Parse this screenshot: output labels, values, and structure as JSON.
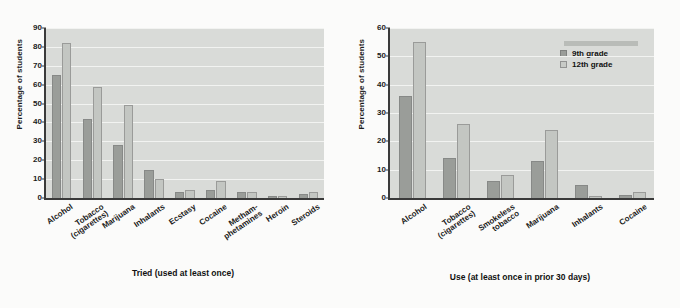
{
  "figure": {
    "background": "#fbfbfa",
    "legend": {
      "position": "top-right",
      "items": [
        {
          "label": "9th grade",
          "color": "#9a9d99"
        },
        {
          "label": "12th grade",
          "color": "#c8cbc7"
        }
      ]
    }
  },
  "chart_data": [
    {
      "type": "bar",
      "title": "",
      "xlabel": "Tried (used at least once)",
      "ylabel": "Percentage of students",
      "ylim": [
        0,
        90
      ],
      "yticks": [
        0,
        10,
        20,
        30,
        40,
        50,
        60,
        70,
        80,
        90
      ],
      "grid": true,
      "legend_position": "none",
      "categories": [
        "Alcohol",
        "Tobacco (cigarettes)",
        "Marijuana",
        "Inhalants",
        "Ecstasy",
        "Cocaine",
        "Metham- phetamines",
        "Heroin",
        "Steroids"
      ],
      "category_lines": [
        [
          "Alcohol"
        ],
        [
          "Tobacco",
          "(cigarettes)"
        ],
        [
          "Marijuana"
        ],
        [
          "Inhalants"
        ],
        [
          "Ecstasy"
        ],
        [
          "Cocaine"
        ],
        [
          "Metham-",
          "phetamines"
        ],
        [
          "Heroin"
        ],
        [
          "Steroids"
        ]
      ],
      "series": [
        {
          "name": "9th grade",
          "color": "#9a9d99",
          "values": [
            65,
            42,
            28,
            15,
            3,
            4,
            3,
            1,
            2
          ]
        },
        {
          "name": "12th grade",
          "color": "#c3c6c2",
          "values": [
            82,
            59,
            49,
            10,
            4,
            9,
            3,
            1,
            3
          ]
        }
      ]
    },
    {
      "type": "bar",
      "title": "",
      "xlabel": "Use (at least once in prior 30 days)",
      "ylabel": "Percentage of students",
      "ylim": [
        0,
        60
      ],
      "yticks": [
        0,
        10,
        20,
        30,
        40,
        50,
        60
      ],
      "grid": true,
      "legend_position": "top-right",
      "categories": [
        "Alcohol",
        "Tobacco (cigarettes)",
        "Smokeless tobacco",
        "Marijuana",
        "Inhalants",
        "Cocaine"
      ],
      "category_lines": [
        [
          "Alcohol"
        ],
        [
          "Tobacco",
          "(cigarettes)"
        ],
        [
          "Smokeless",
          "tobacco"
        ],
        [
          "Marijuana"
        ],
        [
          "Inhalants"
        ],
        [
          "Cocaine"
        ]
      ],
      "series": [
        {
          "name": "9th grade",
          "color": "#9a9d99",
          "values": [
            36,
            14,
            6,
            13,
            4.5,
            1
          ]
        },
        {
          "name": "12th grade",
          "color": "#c3c6c2",
          "values": [
            55,
            26,
            8,
            24,
            0.7,
            2
          ]
        }
      ]
    }
  ]
}
